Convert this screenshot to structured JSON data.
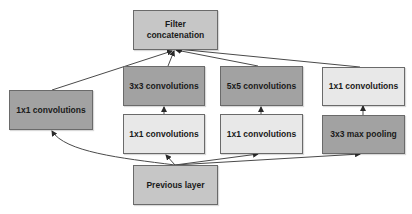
{
  "diagram": {
    "colors": {
      "mid": "#c6c6c6",
      "dark": "#a2a2a2",
      "light": "#e8e8e8",
      "border": "#6a6a6a",
      "edge": "#4a4a4a"
    },
    "nodes": {
      "filter_concat": "Filter\nconcatenation",
      "conv1x1_left": "1x1 convolutions",
      "conv3x3": "3x3 convolutions",
      "conv5x5": "5x5 convolutions",
      "conv1x1_pool_proj": "1x1 convolutions",
      "conv1x1_reduce_3x3": "1x1 convolutions",
      "conv1x1_reduce_5x5": "1x1 convolutions",
      "maxpool3x3": "3x3 max pooling",
      "previous_layer": "Previous layer"
    },
    "edges": [
      {
        "from": "previous_layer",
        "to": "conv1x1_left"
      },
      {
        "from": "previous_layer",
        "to": "conv1x1_reduce_3x3"
      },
      {
        "from": "previous_layer",
        "to": "conv1x1_reduce_5x5"
      },
      {
        "from": "previous_layer",
        "to": "maxpool3x3"
      },
      {
        "from": "conv1x1_reduce_3x3",
        "to": "conv3x3"
      },
      {
        "from": "conv1x1_reduce_5x5",
        "to": "conv5x5"
      },
      {
        "from": "maxpool3x3",
        "to": "conv1x1_pool_proj"
      },
      {
        "from": "conv1x1_left",
        "to": "filter_concat"
      },
      {
        "from": "conv3x3",
        "to": "filter_concat"
      },
      {
        "from": "conv5x5",
        "to": "filter_concat"
      },
      {
        "from": "conv1x1_pool_proj",
        "to": "filter_concat"
      }
    ]
  }
}
